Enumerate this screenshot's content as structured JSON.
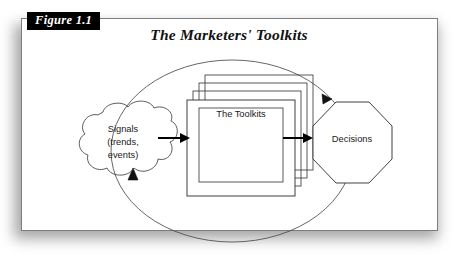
{
  "figure": {
    "label": "Figure 1.1",
    "title": "The Marketers' Toolkits"
  },
  "diagram": {
    "type": "flow-cycle",
    "nodes": [
      {
        "id": "signals",
        "shape": "cloud",
        "lines": [
          "Signals",
          "(trends,",
          "events)"
        ],
        "line1": "Signals",
        "line2": "(trends,",
        "line3": "events)"
      },
      {
        "id": "toolkits",
        "shape": "stacked-rectangles",
        "stack_count": 4,
        "label": "The Toolkits"
      },
      {
        "id": "decisions",
        "shape": "octagon",
        "label": "Decisions"
      }
    ],
    "connections": [
      {
        "from": "signals",
        "to": "toolkits",
        "style": "solid-arrow"
      },
      {
        "from": "toolkits",
        "to": "decisions",
        "style": "solid-arrow"
      },
      {
        "from": "decisions",
        "to": "signals",
        "style": "feedback-ellipse"
      }
    ]
  },
  "colors": {
    "ink": "#000000",
    "line": "#3d3d3d",
    "card": "#ffffff",
    "label_bg": "#000000",
    "label_fg": "#ffffff"
  }
}
